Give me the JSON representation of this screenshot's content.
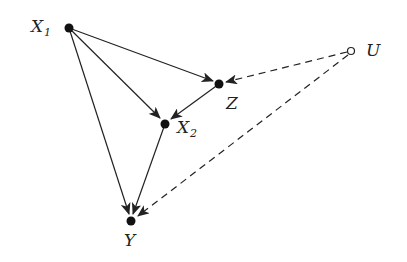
{
  "diagram": {
    "type": "causal-dag",
    "nodes": [
      {
        "id": "X1",
        "label": "X",
        "subscript": "1",
        "observed": true
      },
      {
        "id": "Z",
        "label": "Z",
        "subscript": "",
        "observed": true
      },
      {
        "id": "U",
        "label": "U",
        "subscript": "",
        "observed": false
      },
      {
        "id": "X2",
        "label": "X",
        "subscript": "2",
        "observed": true
      },
      {
        "id": "Y",
        "label": "Y",
        "subscript": "",
        "observed": true
      }
    ],
    "edges": [
      {
        "from": "X1",
        "to": "Z",
        "style": "solid"
      },
      {
        "from": "X1",
        "to": "X2",
        "style": "solid"
      },
      {
        "from": "X1",
        "to": "Y",
        "style": "solid"
      },
      {
        "from": "Z",
        "to": "X2",
        "style": "solid"
      },
      {
        "from": "X2",
        "to": "Y",
        "style": "solid"
      },
      {
        "from": "U",
        "to": "Z",
        "style": "dashed"
      },
      {
        "from": "U",
        "to": "Y",
        "style": "dashed"
      }
    ],
    "colors": {
      "line": "#222222",
      "background": "#ffffff"
    }
  }
}
